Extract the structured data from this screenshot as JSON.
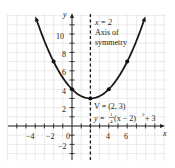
{
  "chart_data": {
    "type": "line",
    "title": "",
    "xlabel": "x",
    "ylabel": "y",
    "xlim": [
      -7,
      10
    ],
    "ylim": [
      -3.5,
      12
    ],
    "grid": true,
    "x_ticks": [
      -4,
      -2,
      0,
      4,
      6
    ],
    "y_ticks": [
      -2,
      2,
      4,
      6,
      8,
      10
    ],
    "x_tick_labels": [
      "-4",
      "-2",
      "0",
      "4",
      "6"
    ],
    "y_tick_labels": [
      "−2",
      "2",
      "4",
      "6",
      "8",
      "10"
    ],
    "series": [
      {
        "name": "y = 1/4(x − 2)^2 + 3",
        "equation": "y = (1/4)(x - 2)^2 + 3",
        "x": [
          -4,
          -2,
          0,
          2,
          4,
          6,
          8
        ],
        "values": [
          12,
          7,
          4,
          3,
          4,
          7,
          12
        ],
        "marked_points": [
          [
            -2,
            7
          ],
          [
            0,
            4
          ],
          [
            2,
            3
          ],
          [
            4,
            4
          ],
          [
            6,
            7
          ]
        ]
      }
    ],
    "annotations": [
      {
        "text": "x = 2",
        "note": "dashed vertical line"
      },
      {
        "text": "Axis of"
      },
      {
        "text": "symmetry"
      },
      {
        "text": "V = (2, 3)",
        "note": "vertex"
      },
      {
        "text": "y = 1/4(x − 2)² + 3"
      }
    ],
    "axis_of_symmetry": 2,
    "vertex": [
      2,
      3
    ]
  },
  "labels": {
    "x_axis": "x",
    "y_axis": "y",
    "origin": "0",
    "sym_line1": "x = 2",
    "sym_line2": "Axis of",
    "sym_line3": "symmetry",
    "vertex": "V = (2, 3)",
    "eq_prefix": "y = ",
    "eq_num": "1",
    "eq_den": "4",
    "eq_suffix": "(x − 2)",
    "eq_exp": "2",
    "eq_tail": " + 3",
    "tick_neg4": "−4",
    "tick_neg2": "−2",
    "tick_4": "4",
    "tick_6": "6",
    "ytick_10": "10",
    "ytick_8": "8",
    "ytick_6": "6",
    "ytick_4": "4",
    "ytick_2": "2",
    "ytick_neg2": "−2"
  }
}
